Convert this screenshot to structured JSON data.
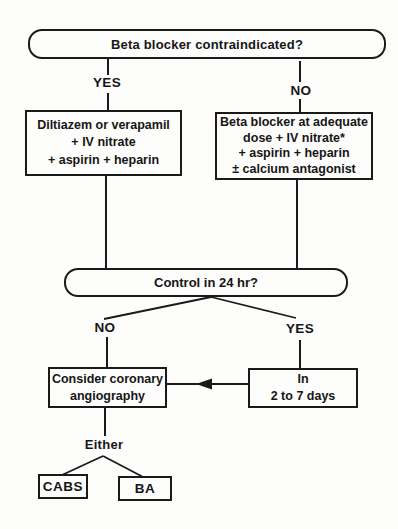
{
  "colors": {
    "ink": "#1a1a1a",
    "paper": "#fdfdfc"
  },
  "flowchart": {
    "top_question": "Beta blocker contraindicated?",
    "top_branches": {
      "yes": "YES",
      "no": "NO"
    },
    "yes_box": {
      "lines": [
        "Diltiazem or verapamil",
        "+ IV nitrate",
        "+ aspirin + heparin"
      ]
    },
    "no_box": {
      "lines": [
        "Beta blocker at adequate",
        "dose + IV nitrate*",
        "+ aspirin + heparin",
        "± calcium antagonist"
      ]
    },
    "control_question": "Control in 24 hr?",
    "control_branches": {
      "no": "NO",
      "yes": "YES"
    },
    "angiography_box": {
      "lines": [
        "Consider coronary",
        "angiography"
      ]
    },
    "delay_box": {
      "lines": [
        "In",
        "2 to 7 days"
      ]
    },
    "either_label": "Either",
    "outcome_cabs": "CABS",
    "outcome_ba": "BA"
  }
}
